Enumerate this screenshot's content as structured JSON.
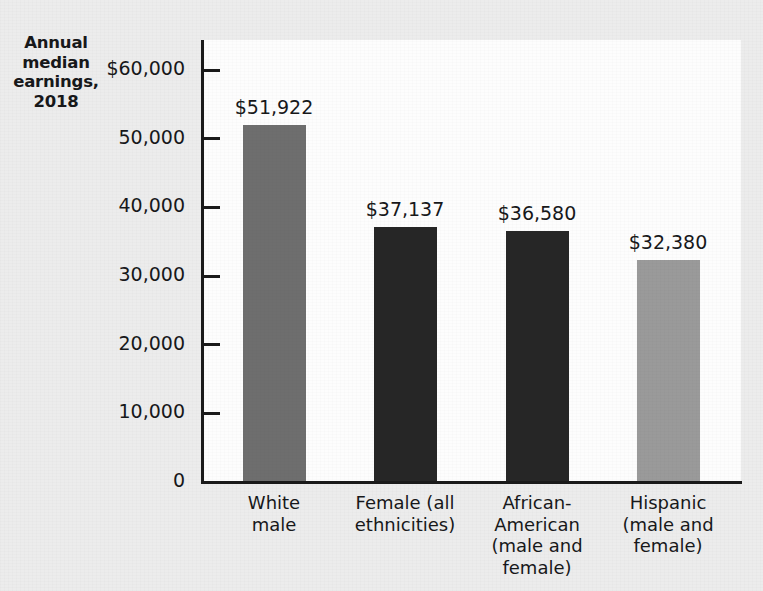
{
  "figure": {
    "y_axis_title": [
      "Annual",
      "median",
      "earnings,",
      "2018"
    ],
    "y_axis_title_text": "Annual median earnings, 2018"
  },
  "chart_data": {
    "type": "bar",
    "xlabel": "",
    "ylabel": "Annual median earnings, 2018",
    "ylim": [
      0,
      60000
    ],
    "grid": false,
    "legend": "none",
    "categories": [
      "White male",
      "Female (all ethnicities)",
      "African-American (male and female)",
      "Hispanic (male and female)"
    ],
    "category_lines": [
      [
        "White",
        "male"
      ],
      [
        "Female (all",
        "ethnicities)"
      ],
      [
        "African-",
        "American",
        "(male and",
        "female)"
      ],
      [
        "Hispanic",
        "(male and",
        "female)"
      ]
    ],
    "values": [
      51922,
      37137,
      36580,
      32380
    ],
    "value_labels": [
      "$51,922",
      "$37,137",
      "$36,580",
      "$32,380"
    ],
    "bar_colors": [
      "#6e6e6e",
      "#262626",
      "#262626",
      "#9a9a9a"
    ],
    "ytick_values": [
      60000,
      50000,
      40000,
      30000,
      20000,
      10000,
      0
    ],
    "ytick_labels": [
      "$60,000",
      "50,000",
      "40,000",
      "30,000",
      "20,000",
      "10,000",
      "0"
    ]
  },
  "colors": {
    "page_background": "#ececec",
    "plot_background": "#fdfdfd",
    "axis": "#1a1a1a",
    "text": "#17181a",
    "bar_gray_medium": "#6e6e6e",
    "bar_near_black": "#262626",
    "bar_gray_light": "#9a9a9a"
  }
}
